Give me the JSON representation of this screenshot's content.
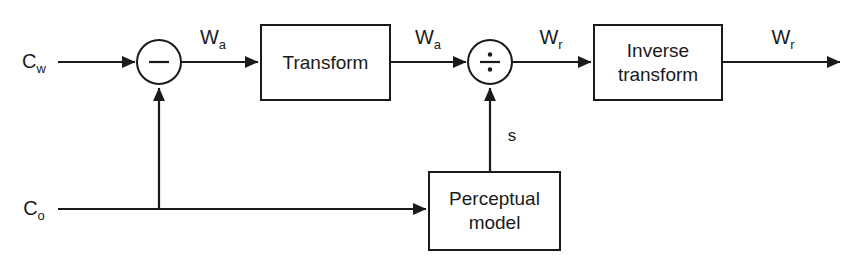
{
  "diagram": {
    "background_color": "#ffffff",
    "line_color": "#1a1a1a",
    "inputs": [
      {
        "id": "cw",
        "base": "C",
        "subscript": "w",
        "label": "Cw"
      },
      {
        "id": "co",
        "base": "C",
        "subscript": "o",
        "label": "Co"
      }
    ],
    "blocks": [
      {
        "id": "transform",
        "label_line1": "Transform",
        "label_line2": ""
      },
      {
        "id": "inverse-transform",
        "label_line1": "Inverse",
        "label_line2": "transform"
      },
      {
        "id": "perceptual-model",
        "label_line1": "Perceptual",
        "label_line2": "model"
      }
    ],
    "operators": [
      {
        "id": "subtract",
        "glyph": "minus",
        "symbol": "−"
      },
      {
        "id": "divide",
        "glyph": "divide",
        "symbol": "÷"
      }
    ],
    "signals": [
      {
        "id": "wa-1",
        "base": "W",
        "subscript": "a",
        "label": "Wa"
      },
      {
        "id": "wa-2",
        "base": "W",
        "subscript": "a",
        "label": "Wa"
      },
      {
        "id": "wr-1",
        "base": "W",
        "subscript": "r",
        "label": "Wr"
      },
      {
        "id": "wr-2",
        "base": "W",
        "subscript": "r",
        "label": "Wr"
      },
      {
        "id": "s",
        "base": "s",
        "subscript": "",
        "label": "s"
      }
    ]
  }
}
